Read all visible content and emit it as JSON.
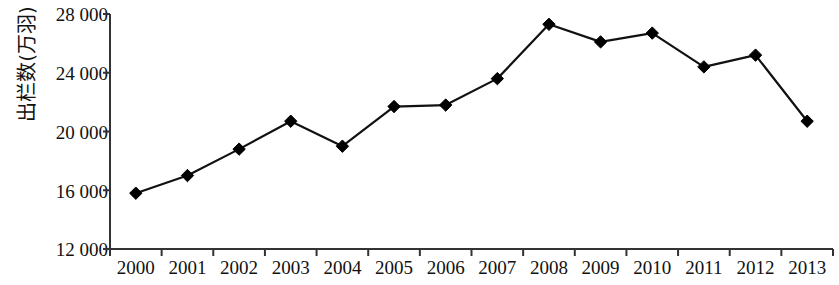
{
  "chart_data": {
    "type": "line",
    "title": "",
    "xlabel": "",
    "ylabel": "出栏数(万羽)",
    "categories": [
      "2000",
      "2001",
      "2002",
      "2003",
      "2004",
      "2005",
      "2006",
      "2007",
      "2008",
      "2009",
      "2010",
      "2011",
      "2012",
      "2013"
    ],
    "values": [
      15800,
      17000,
      18800,
      20700,
      19000,
      21700,
      21800,
      23600,
      27300,
      26100,
      26700,
      24400,
      25200,
      20700
    ],
    "series": [
      {
        "name": "出栏数",
        "values": [
          15800,
          17000,
          18800,
          20700,
          19000,
          21700,
          21800,
          23600,
          27300,
          26100,
          26700,
          24400,
          25200,
          20700
        ]
      }
    ],
    "ylim": [
      12000,
      28000
    ],
    "yticks": [
      12000,
      16000,
      20000,
      24000,
      28000
    ],
    "ytick_labels": [
      "12 000",
      "16 000",
      "20 000",
      "24 000",
      "28 000"
    ],
    "grid": false,
    "legend": false,
    "legend_position": "none",
    "marker": "diamond",
    "line_color": "#111111",
    "marker_color": "#000000",
    "axis_color": "#333333",
    "background_color": "#ffffff"
  }
}
